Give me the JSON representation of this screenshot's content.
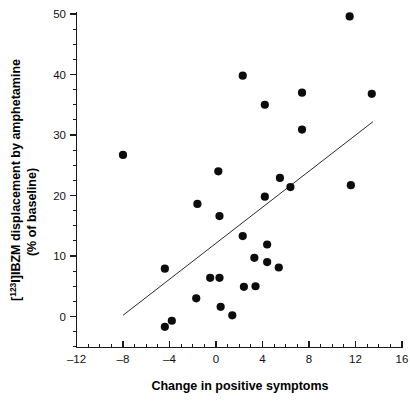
{
  "chart_data": {
    "type": "scatter",
    "title": "",
    "xlabel": "Change in positive symptoms",
    "ylabel_line1": "[123I]IBZM displacement by amphetamine",
    "ylabel_line2": "(% of baseline)",
    "ylabel_superscript": "123",
    "ylabel_prefix": "[",
    "ylabel_suffix": "I]IBZM displacement by amphetamine",
    "xlim": [
      -12,
      16
    ],
    "ylim": [
      -5,
      50
    ],
    "y_axis_visible_range": [
      0,
      50
    ],
    "xticks": [
      -12,
      -8,
      -4,
      0,
      4,
      8,
      12,
      16
    ],
    "xtick_labels": [
      "–12",
      "–8",
      "–4",
      "0",
      "4",
      "8",
      "12",
      "16"
    ],
    "yticks": [
      0,
      10,
      20,
      30,
      40,
      50
    ],
    "ytick_labels": [
      "0",
      "10",
      "20",
      "30",
      "40",
      "50"
    ],
    "x_minor_step": 1,
    "y_minor_step": 2.5,
    "grid": false,
    "legend": null,
    "marker": "filled-circle",
    "marker_color": "#0c0c0c",
    "marker_size_px": 5.2,
    "points": [
      {
        "x": -8.0,
        "y": 26.7
      },
      {
        "x": -4.4,
        "y": 7.9
      },
      {
        "x": -4.4,
        "y": -1.7
      },
      {
        "x": -3.8,
        "y": -0.7
      },
      {
        "x": -1.6,
        "y": 18.6
      },
      {
        "x": -1.7,
        "y": 3.0
      },
      {
        "x": -0.5,
        "y": 6.4
      },
      {
        "x": 0.2,
        "y": 24.0
      },
      {
        "x": 0.3,
        "y": 16.6
      },
      {
        "x": 0.3,
        "y": 6.4
      },
      {
        "x": 0.4,
        "y": 1.6
      },
      {
        "x": 1.4,
        "y": 0.2
      },
      {
        "x": 2.3,
        "y": 39.8
      },
      {
        "x": 2.3,
        "y": 13.3
      },
      {
        "x": 2.4,
        "y": 4.9
      },
      {
        "x": 3.3,
        "y": 9.7
      },
      {
        "x": 3.4,
        "y": 5.0
      },
      {
        "x": 4.2,
        "y": 35.0
      },
      {
        "x": 4.2,
        "y": 19.8
      },
      {
        "x": 4.4,
        "y": 11.9
      },
      {
        "x": 4.4,
        "y": 9.0
      },
      {
        "x": 5.4,
        "y": 8.1
      },
      {
        "x": 5.5,
        "y": 22.9
      },
      {
        "x": 6.4,
        "y": 21.4
      },
      {
        "x": 7.4,
        "y": 37.0
      },
      {
        "x": 7.4,
        "y": 30.9
      },
      {
        "x": 11.5,
        "y": 49.6
      },
      {
        "x": 11.6,
        "y": 21.7
      },
      {
        "x": 13.4,
        "y": 36.8
      }
    ],
    "fit_line": {
      "type": "linear-regression",
      "x_start": -8.0,
      "y_start": 0.2,
      "x_end": 13.5,
      "y_end": 32.2,
      "color": "#2a2a2a"
    }
  }
}
